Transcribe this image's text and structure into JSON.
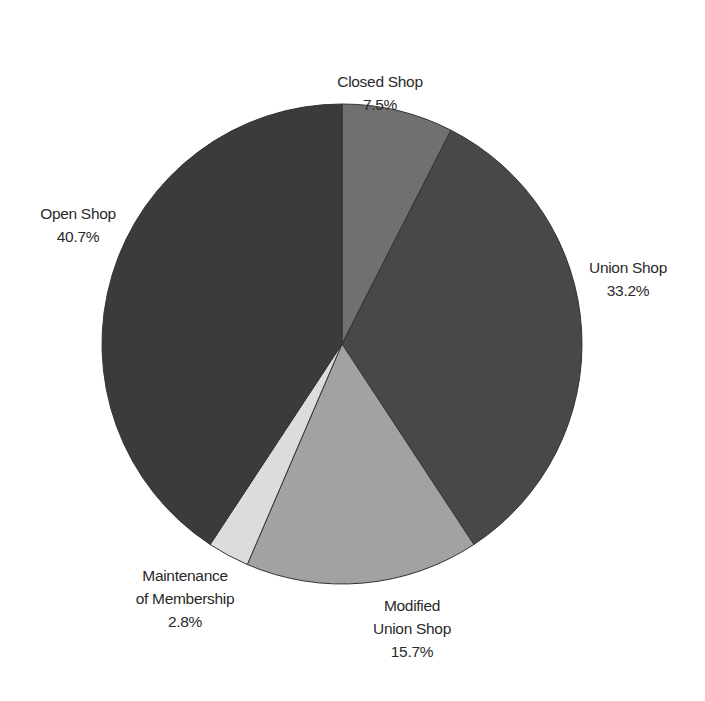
{
  "chart_data": {
    "type": "pie",
    "title": "",
    "start_angle_deg": 0,
    "direction": "clockwise",
    "center": [
      342,
      344
    ],
    "radius": 240,
    "slices": [
      {
        "label": "Closed Shop",
        "lines": [
          "Closed Shop"
        ],
        "value": 7.5,
        "value_label": "7.5%",
        "color": "#707070",
        "label_pos": [
          380,
          70
        ]
      },
      {
        "label": "Union Shop",
        "lines": [
          "Union Shop"
        ],
        "value": 33.2,
        "value_label": "33.2%",
        "color": "#484848",
        "label_pos": [
          628,
          256
        ]
      },
      {
        "label": "Modified Union Shop",
        "lines": [
          "Modified",
          "Union Shop"
        ],
        "value": 15.7,
        "value_label": "15.7%",
        "color": "#a2a2a2",
        "label_pos": [
          412,
          594
        ]
      },
      {
        "label": "Maintenance of Membership",
        "lines": [
          "Maintenance",
          "of Membership"
        ],
        "value": 2.8,
        "value_label": "2.8%",
        "color": "#dcdcdc",
        "label_pos": [
          185,
          564
        ]
      },
      {
        "label": "Open Shop",
        "lines": [
          "Open Shop"
        ],
        "value": 40.7,
        "value_label": "40.7%",
        "color": "#3b3b3b",
        "label_pos": [
          78,
          202
        ]
      }
    ]
  }
}
